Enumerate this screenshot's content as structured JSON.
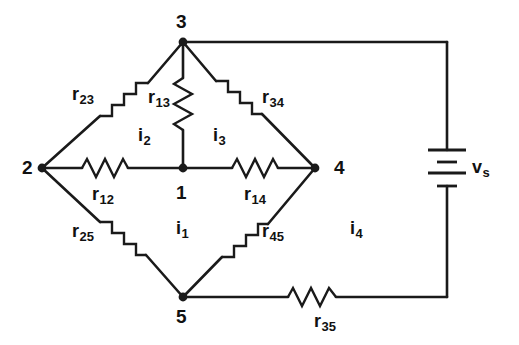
{
  "figure": {
    "type": "circuit-schematic",
    "stroke_color": "#1a1a1a",
    "background_color": "#ffffff"
  },
  "nodes": [
    {
      "id": "n1",
      "label": "1",
      "x": 183,
      "y": 168,
      "label_x": 176,
      "label_y": 183,
      "dot": true
    },
    {
      "id": "n2",
      "label": "2",
      "x": 42,
      "y": 168,
      "label_x": 22,
      "label_y": 158,
      "dot": true
    },
    {
      "id": "n3",
      "label": "3",
      "x": 183,
      "y": 42,
      "label_x": 176,
      "label_y": 12,
      "dot": true
    },
    {
      "id": "n4",
      "label": "4",
      "x": 315,
      "y": 168,
      "label_x": 334,
      "label_y": 158,
      "dot": true
    },
    {
      "id": "n5",
      "label": "5",
      "x": 183,
      "y": 297,
      "label_x": 176,
      "label_y": 307,
      "dot": true
    }
  ],
  "resistors": [
    {
      "id": "r23",
      "symbol": "r",
      "subscript": "23",
      "between": [
        "2",
        "3"
      ],
      "orientation": "diagonal",
      "label_x": 72,
      "label_y": 85
    },
    {
      "id": "r13",
      "symbol": "r",
      "subscript": "13",
      "between": [
        "1",
        "3"
      ],
      "orientation": "vertical",
      "label_x": 148,
      "label_y": 88
    },
    {
      "id": "r34",
      "symbol": "r",
      "subscript": "34",
      "between": [
        "3",
        "4"
      ],
      "orientation": "diagonal",
      "label_x": 262,
      "label_y": 88
    },
    {
      "id": "r12",
      "symbol": "r",
      "subscript": "12",
      "between": [
        "1",
        "2"
      ],
      "orientation": "horizontal",
      "label_x": 92,
      "label_y": 185
    },
    {
      "id": "r14",
      "symbol": "r",
      "subscript": "14",
      "between": [
        "1",
        "4"
      ],
      "orientation": "horizontal",
      "label_x": 244,
      "label_y": 185
    },
    {
      "id": "r25",
      "symbol": "r",
      "subscript": "25",
      "between": [
        "2",
        "5"
      ],
      "orientation": "diagonal",
      "label_x": 72,
      "label_y": 222
    },
    {
      "id": "r45",
      "symbol": "r",
      "subscript": "45",
      "between": [
        "4",
        "5"
      ],
      "orientation": "diagonal",
      "label_x": 262,
      "label_y": 222
    },
    {
      "id": "r35",
      "symbol": "r",
      "subscript": "35",
      "between": [
        "3",
        "5"
      ],
      "orientation": "horizontal",
      "label_x": 314,
      "label_y": 312
    }
  ],
  "mesh_currents": [
    {
      "id": "i1",
      "symbol": "i",
      "subscript": "1",
      "label_x": 176,
      "label_y": 219
    },
    {
      "id": "i2",
      "symbol": "i",
      "subscript": "2",
      "label_x": 138,
      "label_y": 126
    },
    {
      "id": "i3",
      "symbol": "i",
      "subscript": "3",
      "label_x": 213,
      "label_y": 126
    },
    {
      "id": "i4",
      "symbol": "i",
      "subscript": "4",
      "label_x": 350,
      "label_y": 219
    }
  ],
  "source": {
    "id": "vs",
    "symbol": "v",
    "subscript": "s",
    "type": "dc-voltage-source-battery",
    "x": 447,
    "y": 168,
    "label_x": 472,
    "label_y": 158
  }
}
